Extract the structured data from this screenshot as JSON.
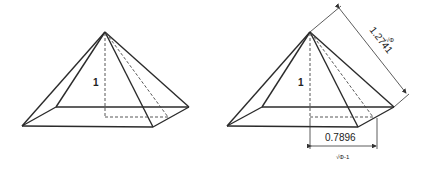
{
  "diagram": {
    "left_pyramid": {
      "height_label": "1"
    },
    "right_pyramid": {
      "height_label": "1",
      "slant_dimension": {
        "value": "1.2741",
        "symbol": "√Φ"
      },
      "half_base_dimension": {
        "value": "0.7896",
        "symbol": "√Φ-1"
      }
    }
  }
}
